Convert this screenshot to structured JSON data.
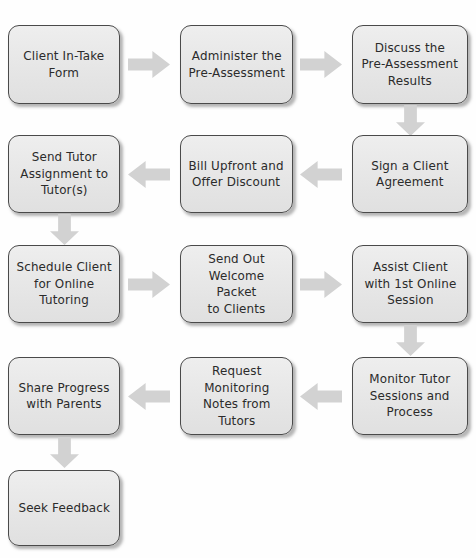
{
  "diagram": {
    "type": "process-flowchart",
    "layout": "serpentine",
    "colors": {
      "node_fill": "#e8e8e8",
      "node_border": "#4a4a4a",
      "node_text": "#2b2b2b",
      "arrow_fill": "#d2d2d2",
      "background": "#ffffff"
    },
    "nodes": [
      {
        "id": "n1",
        "row": 1,
        "col": 1,
        "label": "Client In-Take\nForm"
      },
      {
        "id": "n2",
        "row": 1,
        "col": 2,
        "label": "Administer the\nPre-Assessment"
      },
      {
        "id": "n3",
        "row": 1,
        "col": 3,
        "label": "Discuss the\nPre-Assessment\nResults"
      },
      {
        "id": "n4",
        "row": 2,
        "col": 3,
        "label": "Sign a Client\nAgreement"
      },
      {
        "id": "n5",
        "row": 2,
        "col": 2,
        "label": "Bill Upfront and\nOffer Discount"
      },
      {
        "id": "n6",
        "row": 2,
        "col": 1,
        "label": "Send Tutor\nAssignment to\nTutor(s)"
      },
      {
        "id": "n7",
        "row": 3,
        "col": 1,
        "label": "Schedule Client\nfor Online\nTutoring"
      },
      {
        "id": "n8",
        "row": 3,
        "col": 2,
        "label": "Send Out\nWelcome Packet\nto Clients"
      },
      {
        "id": "n9",
        "row": 3,
        "col": 3,
        "label": "Assist Client\nwith 1st Online\nSession"
      },
      {
        "id": "n10",
        "row": 4,
        "col": 3,
        "label": "Monitor Tutor\nSessions and\nProcess"
      },
      {
        "id": "n11",
        "row": 4,
        "col": 2,
        "label": "Request\nMonitoring\nNotes from\nTutors"
      },
      {
        "id": "n12",
        "row": 4,
        "col": 1,
        "label": "Share Progress\nwith Parents"
      },
      {
        "id": "n13",
        "row": 5,
        "col": 1,
        "label": "Seek Feedback"
      }
    ],
    "connectors": [
      {
        "id": "a1",
        "from": "n1",
        "to": "n2",
        "direction": "right",
        "icon": "arrow-right-icon"
      },
      {
        "id": "a2",
        "from": "n2",
        "to": "n3",
        "direction": "right",
        "icon": "arrow-right-icon"
      },
      {
        "id": "a3",
        "from": "n3",
        "to": "n4",
        "direction": "down",
        "icon": "arrow-down-icon"
      },
      {
        "id": "a4",
        "from": "n4",
        "to": "n5",
        "direction": "left",
        "icon": "arrow-left-icon"
      },
      {
        "id": "a5",
        "from": "n5",
        "to": "n6",
        "direction": "left",
        "icon": "arrow-left-icon"
      },
      {
        "id": "a6",
        "from": "n6",
        "to": "n7",
        "direction": "down",
        "icon": "arrow-down-icon"
      },
      {
        "id": "a7",
        "from": "n7",
        "to": "n8",
        "direction": "right",
        "icon": "arrow-right-icon"
      },
      {
        "id": "a8",
        "from": "n8",
        "to": "n9",
        "direction": "right",
        "icon": "arrow-right-icon"
      },
      {
        "id": "a9",
        "from": "n9",
        "to": "n10",
        "direction": "down",
        "icon": "arrow-down-icon"
      },
      {
        "id": "a10",
        "from": "n10",
        "to": "n11",
        "direction": "left",
        "icon": "arrow-left-icon"
      },
      {
        "id": "a11",
        "from": "n11",
        "to": "n12",
        "direction": "left",
        "icon": "arrow-left-icon"
      },
      {
        "id": "a12",
        "from": "n12",
        "to": "n13",
        "direction": "down",
        "icon": "arrow-down-icon"
      }
    ]
  }
}
